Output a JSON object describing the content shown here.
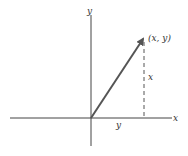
{
  "diagram": {
    "axis_labels": {
      "vertical": "y",
      "horizontal": "x"
    },
    "point_label": "(x, y)",
    "vertical_component_label": "x",
    "horizontal_component_label": "y",
    "colors": {
      "axis": "#444444",
      "vector": "#555555",
      "dashed": "#555555",
      "text": "#333333"
    }
  }
}
